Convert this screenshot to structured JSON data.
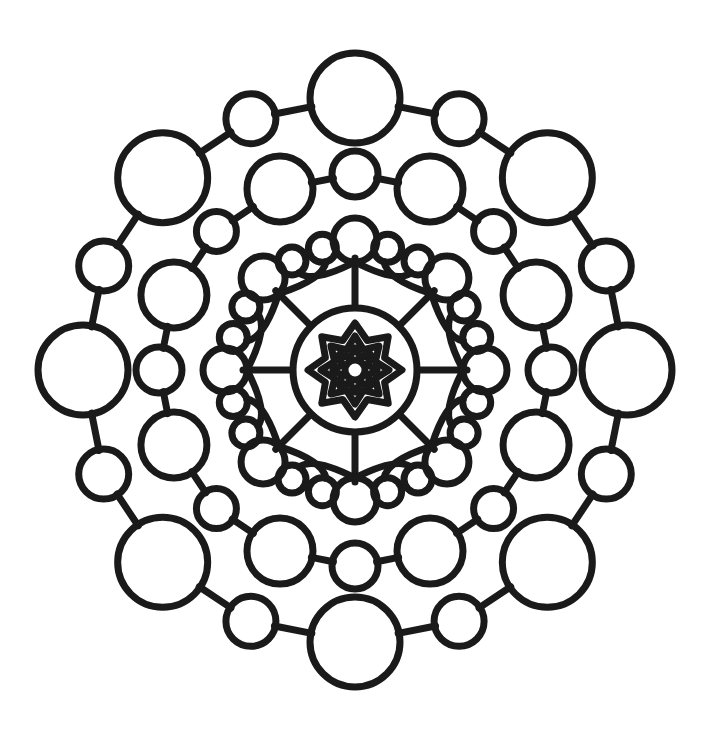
{
  "artwork": {
    "title": "Mandala Coloring Page",
    "type": "line-art-mandala",
    "symmetry_order": 8,
    "canvas": {
      "width": 722,
      "height": 733,
      "background": "#ffffff"
    },
    "center": {
      "x": 355,
      "y": 370
    },
    "ink_color": "#1a1a1a",
    "stroke_width": 7
  },
  "rings": [
    {
      "name": "outer-ring",
      "description": "Outermost necklace of alternating large and small circles joined by short connector segments",
      "radius": 272,
      "count": 16,
      "connectors": true,
      "nodes": [
        {
          "index": 0,
          "angle_deg": -90,
          "radius": 272,
          "circle_radius": 45
        },
        {
          "index": 1,
          "angle_deg": -67.5,
          "radius": 272,
          "circle_radius": 25
        },
        {
          "index": 2,
          "angle_deg": -45,
          "radius": 272,
          "circle_radius": 45
        },
        {
          "index": 3,
          "angle_deg": -22.5,
          "radius": 272,
          "circle_radius": 25
        },
        {
          "index": 4,
          "angle_deg": 0,
          "radius": 272,
          "circle_radius": 45
        },
        {
          "index": 5,
          "angle_deg": 22.5,
          "radius": 272,
          "circle_radius": 25
        },
        {
          "index": 6,
          "angle_deg": 45,
          "radius": 272,
          "circle_radius": 45
        },
        {
          "index": 7,
          "angle_deg": 67.5,
          "radius": 272,
          "circle_radius": 25
        },
        {
          "index": 8,
          "angle_deg": 90,
          "radius": 272,
          "circle_radius": 45
        },
        {
          "index": 9,
          "angle_deg": 112.5,
          "radius": 272,
          "circle_radius": 25
        },
        {
          "index": 10,
          "angle_deg": 135,
          "radius": 272,
          "circle_radius": 45
        },
        {
          "index": 11,
          "angle_deg": 157.5,
          "radius": 272,
          "circle_radius": 25
        },
        {
          "index": 12,
          "angle_deg": 180,
          "radius": 272,
          "circle_radius": 45
        },
        {
          "index": 13,
          "angle_deg": 202.5,
          "radius": 272,
          "circle_radius": 25
        },
        {
          "index": 14,
          "angle_deg": 225,
          "radius": 272,
          "circle_radius": 45
        },
        {
          "index": 15,
          "angle_deg": 247.5,
          "radius": 272,
          "circle_radius": 25
        }
      ]
    },
    {
      "name": "second-ring",
      "description": "Second necklace of alternating large and small circles, rotated half a step from the outer ring",
      "radius": 196,
      "count": 16,
      "connectors": true,
      "nodes": [
        {
          "index": 0,
          "angle_deg": -90,
          "radius": 196,
          "circle_radius": 23
        },
        {
          "index": 1,
          "angle_deg": -67.5,
          "radius": 196,
          "circle_radius": 33
        },
        {
          "index": 2,
          "angle_deg": -45,
          "radius": 196,
          "circle_radius": 20
        },
        {
          "index": 3,
          "angle_deg": -22.5,
          "radius": 196,
          "circle_radius": 33
        },
        {
          "index": 4,
          "angle_deg": 0,
          "radius": 196,
          "circle_radius": 23
        },
        {
          "index": 5,
          "angle_deg": 22.5,
          "radius": 196,
          "circle_radius": 33
        },
        {
          "index": 6,
          "angle_deg": 45,
          "radius": 196,
          "circle_radius": 20
        },
        {
          "index": 7,
          "angle_deg": 67.5,
          "radius": 196,
          "circle_radius": 33
        },
        {
          "index": 8,
          "angle_deg": 90,
          "radius": 196,
          "circle_radius": 23
        },
        {
          "index": 9,
          "angle_deg": 112.5,
          "radius": 196,
          "circle_radius": 33
        },
        {
          "index": 10,
          "angle_deg": 135,
          "radius": 196,
          "circle_radius": 20
        },
        {
          "index": 11,
          "angle_deg": 157.5,
          "radius": 196,
          "circle_radius": 33
        },
        {
          "index": 12,
          "angle_deg": 180,
          "radius": 196,
          "circle_radius": 23
        },
        {
          "index": 13,
          "angle_deg": 202.5,
          "radius": 196,
          "circle_radius": 33
        },
        {
          "index": 14,
          "angle_deg": 225,
          "radius": 196,
          "circle_radius": 20
        },
        {
          "index": 15,
          "angle_deg": 247.5,
          "radius": 196,
          "circle_radius": 33
        }
      ]
    }
  ],
  "petals": {
    "name": "antenna-petals",
    "description": "Eight radial stems rising from the inner disc, each carrying a circle at its tip plus two curved side arms ending in small circles",
    "count": 8,
    "angles_deg": [
      -90,
      -45,
      0,
      45,
      90,
      135,
      180,
      225
    ],
    "stem_start_radius": 64,
    "stem_end_radius": 108,
    "tip_circle_radius": 22,
    "tip_circle_center_radius": 130,
    "arm_tip_circle_radius": 14,
    "arm_tip_center_radius": 126,
    "arm_spread_deg": 30,
    "arm_control_radius": 96
  },
  "inner_disc": {
    "name": "inner-disc",
    "description": "Central circle containing three nested eight-point star outlines around a small hub circle",
    "circle_radius": 62,
    "star_points": 8,
    "stars": [
      {
        "index": 0,
        "outer_radius": 47,
        "inner_radius": 32,
        "label": "outer-star"
      },
      {
        "index": 1,
        "outer_radius": 34,
        "inner_radius": 22,
        "label": "middle-star"
      },
      {
        "index": 2,
        "outer_radius": 22,
        "inner_radius": 14,
        "label": "inner-star"
      }
    ],
    "hub_circle_radius": 10
  }
}
